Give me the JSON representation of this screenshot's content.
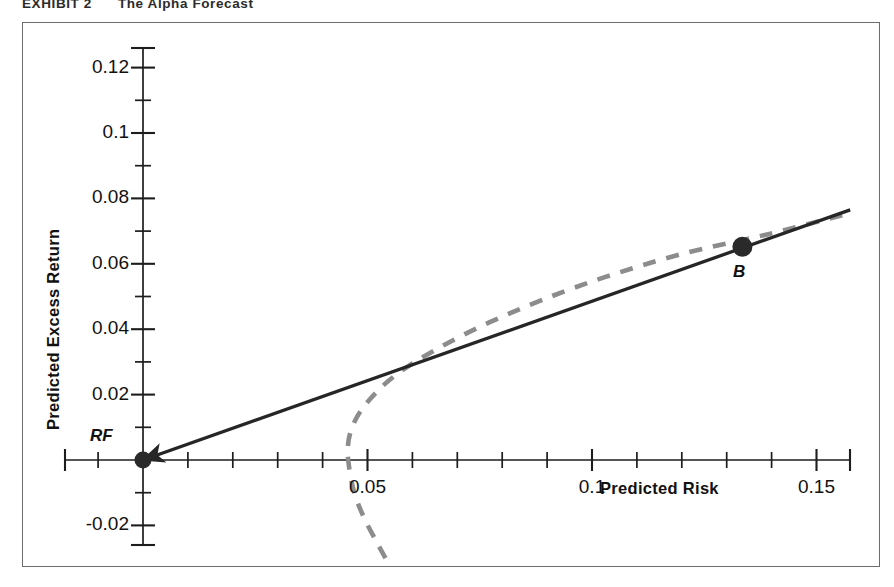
{
  "exhibit": {
    "number": "EXHIBIT 2",
    "title": "The Alpha Forecast"
  },
  "chart_data": {
    "type": "line",
    "title": "The Alpha Forecast",
    "xlabel": "Predicted Risk",
    "ylabel": "Predicted Excess Return",
    "xlim": [
      -0.0175,
      0.1575
    ],
    "ylim": [
      -0.031,
      0.134
    ],
    "grid": false,
    "legend_position": "none",
    "x_tick_labels": [
      "0.05",
      "0.1",
      "0.15"
    ],
    "x_tick_values": [
      0.05,
      0.1,
      0.15
    ],
    "x_minor_step": 0.01,
    "y_tick_labels": [
      "0.12",
      "0.1",
      "0.08",
      "0.06",
      "0.04",
      "0.02",
      "-0.02"
    ],
    "y_tick_values": [
      0.12,
      0.1,
      0.08,
      0.06,
      0.04,
      0.02,
      -0.02
    ],
    "y_minor_step": 0.01,
    "series": [
      {
        "name": "Capital Allocation Line",
        "style": "solid",
        "color": "#262626",
        "arrow_at_start": true,
        "points": [
          [
            0.0,
            0.0
          ],
          [
            0.1575,
            0.0765
          ]
        ]
      },
      {
        "name": "Efficient Frontier",
        "style": "dashed",
        "color": "#8c8c8c",
        "points": [
          [
            0.054,
            -0.03
          ],
          [
            0.052,
            -0.025
          ],
          [
            0.0497,
            -0.019
          ],
          [
            0.0478,
            -0.013
          ],
          [
            0.0465,
            -0.007
          ],
          [
            0.0458,
            -0.001
          ],
          [
            0.0456,
            0.0035
          ],
          [
            0.0462,
            0.0085
          ],
          [
            0.0478,
            0.0135
          ],
          [
            0.0505,
            0.0185
          ],
          [
            0.0545,
            0.024
          ],
          [
            0.06,
            0.0295
          ],
          [
            0.0675,
            0.0355
          ],
          [
            0.077,
            0.042
          ],
          [
            0.089,
            0.049
          ],
          [
            0.103,
            0.056
          ],
          [
            0.12,
            0.063
          ],
          [
            0.139,
            0.069
          ],
          [
            0.1575,
            0.0755
          ]
        ]
      }
    ],
    "annotations": [
      {
        "name": "RF",
        "label": "RF",
        "x": 0.0,
        "y": 0.0,
        "marker": "filled-circle"
      },
      {
        "name": "B",
        "label": "B",
        "x": 0.1335,
        "y": 0.0652,
        "marker": "filled-circle"
      }
    ]
  }
}
